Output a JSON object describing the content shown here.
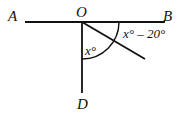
{
  "diagram": {
    "points": {
      "A": "A",
      "O": "O",
      "B": "B",
      "D": "D"
    },
    "angles": {
      "DOC": "x°",
      "COB": "x° – 20°"
    },
    "colors": {
      "ink": "#111111",
      "background": "#ffffff"
    }
  }
}
